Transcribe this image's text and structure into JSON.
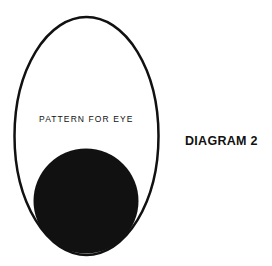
{
  "diagram": {
    "pattern_label": "PATTERN FOR EYE",
    "title": "DIAGRAM 2",
    "colors": {
      "background": "#ffffff",
      "ink": "#111111"
    },
    "shapes": {
      "outer_oval": {
        "cx": 86.5,
        "cy": 136,
        "rx": 72,
        "ry": 119,
        "stroke_width": 2.5
      },
      "pupil_circle": {
        "cx": 86,
        "cy": 201,
        "r": 52.5
      }
    }
  }
}
